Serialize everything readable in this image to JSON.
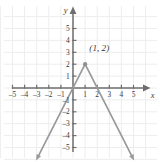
{
  "chart_data": {
    "type": "line",
    "title": "",
    "xlabel": "x",
    "ylabel": "y",
    "xlim": [
      -6.1,
      6.2
    ],
    "ylim": [
      -6.4,
      6.4
    ],
    "grid": true,
    "legend": false,
    "x_ticks": [
      -5,
      -4,
      -3,
      -2,
      -1,
      1,
      2,
      3,
      4,
      5
    ],
    "y_ticks": [
      -5,
      -4,
      -3,
      -2,
      -1,
      1,
      2,
      3,
      4,
      5
    ],
    "x_tick_labels": [
      "-5",
      "-4",
      "-3",
      "-2",
      "-1",
      "1",
      "2",
      "3",
      "4",
      "5"
    ],
    "y_tick_labels": [
      "-5",
      "-4",
      "-3",
      "-2",
      "-1",
      "1",
      "2",
      "3",
      "4",
      "5"
    ],
    "series": [
      {
        "name": "y = -2|x - 1| + 2",
        "x": [
          -3.05,
          1,
          5.05
        ],
        "values": [
          -6.1,
          2,
          -6.1
        ],
        "color": "#9a9a9a",
        "arrow_start": true,
        "arrow_end": true
      }
    ],
    "points": [
      {
        "name": "vertex",
        "x": 1,
        "y": 2,
        "label": "(1, 2)",
        "color": "#8f8f8f"
      }
    ],
    "annotations": [
      {
        "name": "vertex-coordinate-label",
        "text": "(1, 2)",
        "x": 1.35,
        "y": 3.1
      }
    ],
    "axis_color": "#6e6e6e",
    "grid_color": "#ededed",
    "curve_color": "#9a9a9a",
    "background": "#ffffff"
  },
  "axes": {
    "x_axis_name": "x",
    "y_axis_name": "y"
  }
}
